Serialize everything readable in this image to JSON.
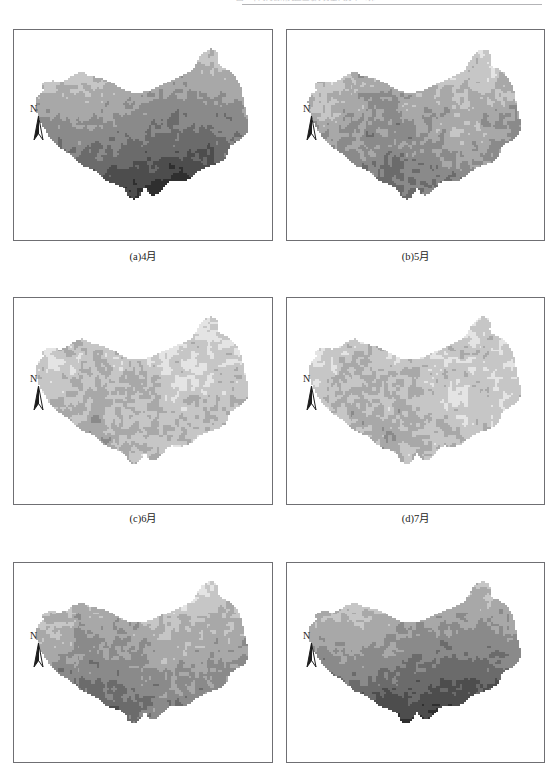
{
  "page": {
    "kind": "scanned-journal-figure-page",
    "width": 556,
    "height": 763,
    "background_color": "#ffffff",
    "ink_color": "#1a1a1a",
    "top_cut_text": "图 4  不同月份研究区土壤水分空间分布（续）",
    "panel_border_color": "#6f6f73"
  },
  "north_arrow": {
    "label": "N",
    "icon": "north-arrow-icon"
  },
  "figure": {
    "caption_prefixes": [
      "(a)",
      "(b)",
      "(c)",
      "(d)",
      "(e)",
      "(f)"
    ],
    "panels": [
      {
        "id": "panel-a",
        "caption": "(a)4月",
        "month": "4月",
        "row": 1,
        "col": 1,
        "x": 13,
        "y": 29,
        "w": 260,
        "h": 212,
        "caption_x": 13,
        "caption_y": 250,
        "caption_w": 260,
        "north_x": 14,
        "north_y": 74,
        "tone": "dark-south",
        "mean_gray": "#6d6d6d",
        "has_caption": true
      },
      {
        "id": "panel-b",
        "caption": "(b)5月",
        "month": "5月",
        "row": 1,
        "col": 2,
        "x": 286,
        "y": 29,
        "w": 259,
        "h": 212,
        "caption_x": 286,
        "caption_y": 250,
        "caption_w": 259,
        "north_x": 14,
        "north_y": 74,
        "tone": "mottled-mid",
        "mean_gray": "#7b7b7b",
        "has_caption": true
      },
      {
        "id": "panel-c",
        "caption": "(c)6月",
        "month": "6月",
        "row": 2,
        "col": 1,
        "x": 13,
        "y": 297,
        "w": 260,
        "h": 208,
        "caption_x": 13,
        "caption_y": 512,
        "caption_w": 260,
        "north_x": 14,
        "north_y": 76,
        "tone": "light-mottled",
        "mean_gray": "#949494",
        "has_caption": true
      },
      {
        "id": "panel-d",
        "caption": "(d)7月",
        "month": "7月",
        "row": 2,
        "col": 2,
        "x": 286,
        "y": 297,
        "w": 259,
        "h": 208,
        "caption_x": 286,
        "caption_y": 512,
        "caption_w": 259,
        "north_x": 14,
        "north_y": 76,
        "tone": "light-mottled",
        "mean_gray": "#999999",
        "has_caption": true
      },
      {
        "id": "panel-e",
        "caption": "",
        "month": "",
        "row": 3,
        "col": 1,
        "x": 13,
        "y": 562,
        "w": 260,
        "h": 201,
        "caption_x": 13,
        "caption_y": 0,
        "caption_w": 260,
        "north_x": 14,
        "north_y": 68,
        "tone": "mottled-dark-south",
        "mean_gray": "#7f7f7f",
        "has_caption": false
      },
      {
        "id": "panel-f",
        "caption": "",
        "month": "",
        "row": 3,
        "col": 2,
        "x": 286,
        "y": 562,
        "w": 259,
        "h": 201,
        "caption_x": 286,
        "caption_y": 0,
        "caption_w": 259,
        "north_x": 14,
        "north_y": 68,
        "tone": "dark-south",
        "mean_gray": "#767676",
        "has_caption": false
      }
    ]
  },
  "chart_data": {
    "type": "heatmap",
    "title": "图 4  不同月份研究区土壤水分空间分布（续）",
    "subtitle": "",
    "xlabel": "",
    "ylabel": "",
    "grid": false,
    "legend": "none",
    "note": "Six grayscale raster maps of the same study region (Northeast China / Songnen basin outline), one per sub-panel; grayscale encodes the mapped variable with darker = higher value.",
    "panels": [
      {
        "label": "(a)4月",
        "month": 4,
        "mean_gray_level": 0.43,
        "dark_fraction_south": 0.55
      },
      {
        "label": "(b)5月",
        "month": 5,
        "mean_gray_level": 0.48,
        "dark_fraction_south": 0.42
      },
      {
        "label": "(c)6月",
        "month": 6,
        "mean_gray_level": 0.58,
        "dark_fraction_south": 0.22
      },
      {
        "label": "(d)7月",
        "month": 7,
        "mean_gray_level": 0.6,
        "dark_fraction_south": 0.18
      },
      {
        "label": "(e)",
        "month": 8,
        "mean_gray_level": 0.5,
        "dark_fraction_south": 0.38
      },
      {
        "label": "(f)",
        "month": 9,
        "mean_gray_level": 0.46,
        "dark_fraction_south": 0.5
      }
    ],
    "gray_scale_ramp": [
      "#2f2f2f",
      "#4d4d4d",
      "#6b6b6b",
      "#8a8a8a",
      "#a8a8a8",
      "#c6c6c6",
      "#e4e4e4"
    ]
  }
}
